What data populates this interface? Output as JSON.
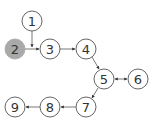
{
  "diagram": {
    "type": "directed-graph",
    "nodes": [
      {
        "id": "1",
        "label": "1",
        "x": 32,
        "y": 21,
        "highlighted": false
      },
      {
        "id": "2",
        "label": "2",
        "x": 15,
        "y": 49,
        "highlighted": true
      },
      {
        "id": "3",
        "label": "3",
        "x": 50,
        "y": 49,
        "highlighted": false
      },
      {
        "id": "4",
        "label": "4",
        "x": 86,
        "y": 49,
        "highlighted": false
      },
      {
        "id": "5",
        "label": "5",
        "x": 104,
        "y": 79,
        "highlighted": false
      },
      {
        "id": "6",
        "label": "6",
        "x": 138,
        "y": 79,
        "highlighted": false
      },
      {
        "id": "7",
        "label": "7",
        "x": 86,
        "y": 107,
        "highlighted": false
      },
      {
        "id": "8",
        "label": "8",
        "x": 50,
        "y": 107,
        "highlighted": false
      },
      {
        "id": "9",
        "label": "9",
        "x": 15,
        "y": 107,
        "highlighted": false
      }
    ],
    "edges": [
      {
        "from": "1",
        "to": "3",
        "via_junction": true
      },
      {
        "from": "2",
        "to": "3"
      },
      {
        "from": "3",
        "to": "4"
      },
      {
        "from": "4",
        "to": "5"
      },
      {
        "from": "5",
        "to": "6",
        "bidirectional": true
      },
      {
        "from": "5",
        "to": "7"
      },
      {
        "from": "7",
        "to": "8"
      },
      {
        "from": "8",
        "to": "9"
      }
    ],
    "colors": {
      "highlight_fill": "#a9a9a9",
      "stroke": "#555555",
      "text": "#333333"
    }
  }
}
